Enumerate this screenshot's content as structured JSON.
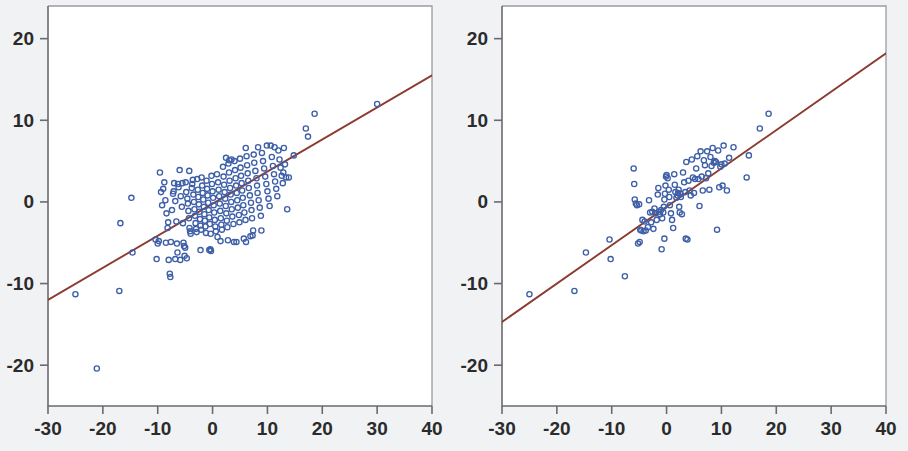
{
  "figure": {
    "background_color": "#f1f2f4",
    "plot_background_color": "#ffffff",
    "panel_count": 2
  },
  "style": {
    "marker_color": "#3d5fa8",
    "marker_shape": "open-circle",
    "marker_radius": 2.6,
    "line_color": "#8c3b30",
    "axis_color": "#6a6a70",
    "frame_color": "#9a9aa2",
    "tick_text_color": "#2b2b2b"
  },
  "chart_data": [
    {
      "type": "scatter",
      "title": "",
      "subtitle": "",
      "xlabel": "",
      "ylabel": "",
      "xlim": [
        -30,
        40
      ],
      "ylim": [
        -25,
        24
      ],
      "xticks": [
        -30,
        -20,
        -10,
        0,
        10,
        20,
        30,
        40
      ],
      "yticks": [
        20,
        10,
        0,
        -10,
        -20
      ],
      "xticklabels": [
        "-30",
        "-20",
        "-10",
        "0",
        "10",
        "20",
        "30",
        "40"
      ],
      "yticklabels": [
        "20",
        "10",
        "0",
        "-10",
        "-20"
      ],
      "grid": false,
      "legend": "none",
      "n_points": 215,
      "fit_line": {
        "label": "regression line",
        "x": [
          -30,
          40
        ],
        "y": [
          -12.0,
          15.5
        ],
        "slope": 0.393,
        "intercept": -0.21
      },
      "points": [
        [
          -25.0,
          -11.3
        ],
        [
          -21.1,
          -20.4
        ],
        [
          -17.0,
          -10.9
        ],
        [
          -16.8,
          -2.6
        ],
        [
          -14.8,
          0.5
        ],
        [
          -14.6,
          -6.2
        ],
        [
          -10.4,
          -4.6
        ],
        [
          -10.2,
          -7.0
        ],
        [
          -10.0,
          -5.1
        ],
        [
          -9.6,
          3.6
        ],
        [
          -9.2,
          -0.4
        ],
        [
          -9.0,
          1.6
        ],
        [
          -8.8,
          2.4
        ],
        [
          -8.6,
          0.2
        ],
        [
          -8.4,
          -1.4
        ],
        [
          -8.2,
          -3.2
        ],
        [
          -8.0,
          -7.1
        ],
        [
          -7.8,
          -8.8
        ],
        [
          -7.7,
          -9.2
        ],
        [
          -7.6,
          -4.9
        ],
        [
          -7.4,
          -1.0
        ],
        [
          -7.2,
          1.0
        ],
        [
          -7.0,
          2.3
        ],
        [
          -6.8,
          0.1
        ],
        [
          -6.6,
          -2.4
        ],
        [
          -6.5,
          -5.1
        ],
        [
          -6.4,
          -6.2
        ],
        [
          -6.2,
          1.8
        ],
        [
          -6.0,
          3.9
        ],
        [
          -5.8,
          0.7
        ],
        [
          -5.6,
          -0.6
        ],
        [
          -5.4,
          -2.6
        ],
        [
          -5.3,
          -5.0
        ],
        [
          -5.2,
          -5.4
        ],
        [
          -5.1,
          -6.6
        ],
        [
          -5.0,
          -5.6
        ],
        [
          -4.9,
          2.4
        ],
        [
          -4.8,
          1.2
        ],
        [
          -4.6,
          0.4
        ],
        [
          -4.5,
          -0.2
        ],
        [
          -4.4,
          -1.1
        ],
        [
          -4.3,
          -2.0
        ],
        [
          -4.2,
          -3.2
        ],
        [
          -4.1,
          -3.6
        ],
        [
          -4.0,
          -3.9
        ],
        [
          -3.8,
          1.7
        ],
        [
          -3.6,
          2.7
        ],
        [
          -3.5,
          0.9
        ],
        [
          -3.4,
          0.0
        ],
        [
          -3.3,
          -0.9
        ],
        [
          -3.2,
          -1.7
        ],
        [
          -3.1,
          -2.6
        ],
        [
          -3.0,
          -3.3
        ],
        [
          -2.9,
          -3.7
        ],
        [
          -2.8,
          2.8
        ],
        [
          -2.7,
          1.5
        ],
        [
          -2.6,
          0.6
        ],
        [
          -2.5,
          -0.3
        ],
        [
          -2.4,
          -1.2
        ],
        [
          -2.3,
          -2.1
        ],
        [
          -2.2,
          -2.9
        ],
        [
          -2.1,
          -3.4
        ],
        [
          -2.0,
          3.0
        ],
        [
          -1.9,
          2.0
        ],
        [
          -1.8,
          1.1
        ],
        [
          -1.7,
          0.3
        ],
        [
          -1.6,
          -0.6
        ],
        [
          -1.5,
          -1.5
        ],
        [
          -1.4,
          -2.3
        ],
        [
          -1.3,
          -3.0
        ],
        [
          -1.2,
          -3.8
        ],
        [
          -1.1,
          2.6
        ],
        [
          -1.0,
          1.6
        ],
        [
          -0.9,
          0.8
        ],
        [
          -0.8,
          -0.1
        ],
        [
          -0.7,
          -1.0
        ],
        [
          -0.6,
          -1.9
        ],
        [
          -0.5,
          -2.7
        ],
        [
          -0.4,
          -5.8
        ],
        [
          -0.3,
          -6.0
        ],
        [
          -0.2,
          3.2
        ],
        [
          -0.1,
          2.2
        ],
        [
          0.0,
          1.3
        ],
        [
          0.1,
          0.5
        ],
        [
          0.2,
          -0.4
        ],
        [
          0.3,
          -1.3
        ],
        [
          0.4,
          -2.2
        ],
        [
          0.5,
          -3.0
        ],
        [
          0.6,
          -3.6
        ],
        [
          0.8,
          3.4
        ],
        [
          1.0,
          2.4
        ],
        [
          1.1,
          1.5
        ],
        [
          1.2,
          0.7
        ],
        [
          1.3,
          -0.2
        ],
        [
          1.4,
          -1.1
        ],
        [
          1.5,
          -2.0
        ],
        [
          1.6,
          -2.8
        ],
        [
          1.7,
          -3.4
        ],
        [
          1.9,
          4.3
        ],
        [
          2.0,
          3.1
        ],
        [
          2.1,
          2.1
        ],
        [
          2.2,
          1.2
        ],
        [
          2.3,
          0.4
        ],
        [
          2.4,
          -0.5
        ],
        [
          2.5,
          -1.4
        ],
        [
          2.6,
          -2.3
        ],
        [
          2.7,
          -3.1
        ],
        [
          2.9,
          4.7
        ],
        [
          3.0,
          3.6
        ],
        [
          3.1,
          2.6
        ],
        [
          3.2,
          1.7
        ],
        [
          3.3,
          0.9
        ],
        [
          3.4,
          0.0
        ],
        [
          3.5,
          -0.9
        ],
        [
          3.6,
          -1.8
        ],
        [
          3.8,
          -2.7
        ],
        [
          3.9,
          -4.9
        ],
        [
          4.0,
          5.0
        ],
        [
          4.1,
          3.9
        ],
        [
          4.2,
          2.9
        ],
        [
          4.3,
          2.0
        ],
        [
          4.4,
          1.1
        ],
        [
          4.5,
          0.2
        ],
        [
          4.6,
          -0.7
        ],
        [
          4.8,
          -1.6
        ],
        [
          4.9,
          -2.5
        ],
        [
          5.0,
          5.3
        ],
        [
          5.1,
          4.2
        ],
        [
          5.2,
          3.2
        ],
        [
          5.3,
          2.3
        ],
        [
          5.4,
          1.4
        ],
        [
          5.5,
          0.5
        ],
        [
          5.6,
          -0.4
        ],
        [
          5.8,
          -1.3
        ],
        [
          6.0,
          -2.2
        ],
        [
          6.1,
          -4.9
        ],
        [
          6.2,
          5.6
        ],
        [
          6.3,
          4.5
        ],
        [
          6.4,
          3.5
        ],
        [
          6.5,
          2.6
        ],
        [
          6.6,
          1.7
        ],
        [
          6.8,
          0.8
        ],
        [
          7.0,
          -0.1
        ],
        [
          7.1,
          -1.0
        ],
        [
          7.2,
          -2.0
        ],
        [
          7.3,
          -4.1
        ],
        [
          7.5,
          5.8
        ],
        [
          7.6,
          4.8
        ],
        [
          7.8,
          3.8
        ],
        [
          8.0,
          2.9
        ],
        [
          8.1,
          2.0
        ],
        [
          8.2,
          1.1
        ],
        [
          8.4,
          0.2
        ],
        [
          8.6,
          -0.7
        ],
        [
          8.8,
          -1.7
        ],
        [
          8.9,
          -3.5
        ],
        [
          9.0,
          6.0
        ],
        [
          9.2,
          5.0
        ],
        [
          9.4,
          4.1
        ],
        [
          9.6,
          3.1
        ],
        [
          9.8,
          2.2
        ],
        [
          10.0,
          1.3
        ],
        [
          10.2,
          0.4
        ],
        [
          10.4,
          -0.5
        ],
        [
          10.6,
          6.9
        ],
        [
          10.8,
          5.5
        ],
        [
          11.0,
          4.4
        ],
        [
          11.2,
          3.4
        ],
        [
          11.4,
          2.5
        ],
        [
          11.6,
          1.6
        ],
        [
          11.8,
          0.7
        ],
        [
          12.0,
          6.3
        ],
        [
          12.2,
          5.2
        ],
        [
          12.4,
          4.2
        ],
        [
          12.6,
          3.2
        ],
        [
          12.8,
          2.3
        ],
        [
          13.0,
          6.6
        ],
        [
          13.2,
          4.6
        ],
        [
          13.4,
          3.0
        ],
        [
          13.6,
          -0.9
        ],
        [
          14.8,
          5.7
        ],
        [
          17.0,
          9.0
        ],
        [
          17.4,
          8.0
        ],
        [
          18.6,
          10.8
        ],
        [
          30.0,
          12.0
        ],
        [
          -6.8,
          -7.0
        ],
        [
          -5.9,
          -7.1
        ],
        [
          -4.7,
          -6.9
        ],
        [
          2.8,
          -4.7
        ],
        [
          5.7,
          -4.5
        ],
        [
          6.9,
          -4.2
        ],
        [
          -0.6,
          -5.9
        ],
        [
          -2.2,
          -5.9
        ],
        [
          7.4,
          -3.5
        ],
        [
          -9.8,
          -4.8
        ],
        [
          -8.5,
          -5.0
        ],
        [
          -3.7,
          2.2
        ],
        [
          -6.3,
          2.2
        ],
        [
          -5.5,
          2.3
        ],
        [
          2.45,
          5.4
        ],
        [
          3.45,
          5.2
        ],
        [
          6.05,
          6.6
        ],
        [
          8.3,
          6.7
        ],
        [
          9.9,
          6.9
        ],
        [
          11.3,
          6.7
        ],
        [
          -7.1,
          1.3
        ],
        [
          -8.1,
          -2.5
        ],
        [
          -9.4,
          1.2
        ],
        [
          0.9,
          -4.3
        ],
        [
          1.45,
          -4.8
        ],
        [
          4.35,
          -4.9
        ],
        [
          -0.35,
          -3.9
        ],
        [
          12.9,
          3.6
        ],
        [
          13.9,
          3.0
        ],
        [
          3.05,
          5.1
        ],
        [
          -4.25,
          3.8
        ]
      ]
    },
    {
      "type": "scatter",
      "title": "",
      "subtitle": "",
      "xlabel": "",
      "ylabel": "",
      "xlim": [
        -30,
        40
      ],
      "ylim": [
        -25,
        24
      ],
      "xticks": [
        -30,
        -20,
        -10,
        0,
        10,
        20,
        30,
        40
      ],
      "yticks": [
        20,
        10,
        0,
        -10,
        -20
      ],
      "xticklabels": [
        "-30",
        "-20",
        "-10",
        "0",
        "10",
        "20",
        "30",
        "40"
      ],
      "yticklabels": [
        "20",
        "10",
        "0",
        "-10",
        "-20"
      ],
      "grid": false,
      "legend": "none",
      "n_points": 110,
      "fit_line": {
        "label": "regression line",
        "x": [
          -30,
          40
        ],
        "y": [
          -14.7,
          18.2
        ],
        "slope": 0.47,
        "intercept": -0.6
      },
      "points": [
        [
          -25.0,
          -11.3
        ],
        [
          -16.8,
          -10.9
        ],
        [
          -14.7,
          -6.2
        ],
        [
          -10.4,
          -4.6
        ],
        [
          -10.2,
          -7.0
        ],
        [
          -7.6,
          -9.1
        ],
        [
          -6.0,
          4.1
        ],
        [
          -5.9,
          2.2
        ],
        [
          -5.8,
          0.3
        ],
        [
          -5.6,
          -0.2
        ],
        [
          -5.4,
          -0.4
        ],
        [
          -5.2,
          -5.1
        ],
        [
          -5.0,
          -0.3
        ],
        [
          -4.8,
          -3.4
        ],
        [
          -4.6,
          -3.5
        ],
        [
          -4.4,
          -2.2
        ],
        [
          -4.2,
          -3.6
        ],
        [
          -4.0,
          -2.4
        ],
        [
          -3.8,
          -3.5
        ],
        [
          -3.4,
          -3.1
        ],
        [
          -3.2,
          0.2
        ],
        [
          -3.0,
          -1.3
        ],
        [
          -2.8,
          -2.5
        ],
        [
          -2.6,
          -1.2
        ],
        [
          -2.4,
          -3.3
        ],
        [
          -2.2,
          -0.8
        ],
        [
          -2.0,
          -1.4
        ],
        [
          -1.8,
          -2.2
        ],
        [
          -1.6,
          0.9
        ],
        [
          -1.5,
          1.7
        ],
        [
          -1.4,
          -1.2
        ],
        [
          -1.2,
          -1.5
        ],
        [
          -1.0,
          -1.0
        ],
        [
          -0.9,
          -5.8
        ],
        [
          -0.8,
          -2.0
        ],
        [
          -0.6,
          -1.3
        ],
        [
          -0.5,
          -0.6
        ],
        [
          -0.4,
          0.3
        ],
        [
          -0.3,
          1.0
        ],
        [
          -0.2,
          2.0
        ],
        [
          -0.1,
          3.1
        ],
        [
          0.0,
          3.3
        ],
        [
          0.2,
          2.9
        ],
        [
          0.4,
          1.5
        ],
        [
          0.5,
          0.6
        ],
        [
          0.6,
          -0.4
        ],
        [
          0.8,
          -1.4
        ],
        [
          1.0,
          -2.2
        ],
        [
          1.2,
          -3.2
        ],
        [
          1.4,
          3.4
        ],
        [
          1.5,
          2.1
        ],
        [
          1.6,
          1.2
        ],
        [
          1.8,
          0.5
        ],
        [
          2.0,
          0.8
        ],
        [
          2.1,
          1.1
        ],
        [
          2.2,
          1.5
        ],
        [
          2.3,
          -0.6
        ],
        [
          2.4,
          -1.3
        ],
        [
          2.5,
          1.0
        ],
        [
          2.6,
          0.6
        ],
        [
          2.8,
          -1.5
        ],
        [
          3.0,
          3.6
        ],
        [
          3.2,
          2.4
        ],
        [
          3.4,
          1.2
        ],
        [
          3.6,
          4.9
        ],
        [
          3.8,
          -4.6
        ],
        [
          4.0,
          2.6
        ],
        [
          4.2,
          1.4
        ],
        [
          4.4,
          0.8
        ],
        [
          4.6,
          5.2
        ],
        [
          4.8,
          3.0
        ],
        [
          5.0,
          1.1
        ],
        [
          5.2,
          2.8
        ],
        [
          5.4,
          4.1
        ],
        [
          5.6,
          5.6
        ],
        [
          5.8,
          2.8
        ],
        [
          6.0,
          -0.5
        ],
        [
          6.2,
          6.2
        ],
        [
          6.4,
          3.1
        ],
        [
          6.6,
          1.4
        ],
        [
          6.8,
          5.1
        ],
        [
          7.0,
          4.5
        ],
        [
          7.2,
          2.9
        ],
        [
          7.4,
          6.2
        ],
        [
          7.6,
          3.5
        ],
        [
          7.8,
          1.5
        ],
        [
          8.0,
          5.5
        ],
        [
          8.2,
          4.4
        ],
        [
          8.4,
          6.6
        ],
        [
          8.6,
          4.8
        ],
        [
          8.8,
          5.0
        ],
        [
          9.0,
          4.9
        ],
        [
          9.2,
          -3.4
        ],
        [
          9.4,
          6.3
        ],
        [
          9.6,
          1.8
        ],
        [
          9.8,
          4.3
        ],
        [
          10.0,
          4.6
        ],
        [
          10.2,
          2.0
        ],
        [
          10.4,
          6.9
        ],
        [
          10.6,
          4.7
        ],
        [
          11.0,
          1.4
        ],
        [
          11.4,
          5.4
        ],
        [
          12.2,
          6.7
        ],
        [
          14.6,
          3.0
        ],
        [
          15.0,
          5.7
        ],
        [
          17.0,
          9.0
        ],
        [
          18.6,
          10.8
        ],
        [
          -4.9,
          -4.9
        ],
        [
          -0.4,
          -4.5
        ],
        [
          3.5,
          -4.5
        ]
      ]
    }
  ]
}
